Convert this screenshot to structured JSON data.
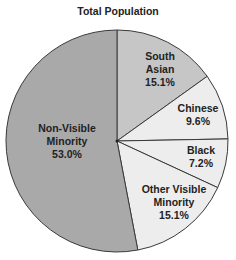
{
  "chart_data": {
    "type": "pie",
    "title": "Total Population",
    "categories": [
      "South Asian",
      "Chinese",
      "Black",
      "Other Visible Minority",
      "Non-Visible Minority"
    ],
    "values": [
      15.1,
      9.6,
      7.2,
      15.1,
      53.0
    ],
    "unit": "%",
    "labels": [
      {
        "name_lines": [
          "South",
          "Asian"
        ],
        "value": "15.1%"
      },
      {
        "name_lines": [
          "Chinese"
        ],
        "value": "9.6%"
      },
      {
        "name_lines": [
          "Black"
        ],
        "value": "7.2%"
      },
      {
        "name_lines": [
          "Other Visible",
          "Minority"
        ],
        "value": "15.1%"
      },
      {
        "name_lines": [
          "Non-Visible",
          "Minority"
        ],
        "value": "53.0%"
      }
    ],
    "colors": [
      "#c6c6c6",
      "#ededed",
      "#ededed",
      "#ededed",
      "#a9a9a9"
    ],
    "start_angle": "12 o'clock, clockwise",
    "legend": "none (inline labels)"
  }
}
